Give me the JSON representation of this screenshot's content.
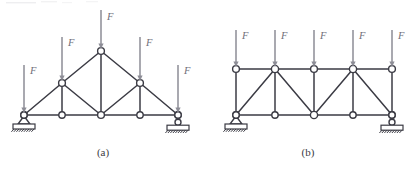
{
  "figure": {
    "background_color": "#ffffff",
    "member_color": "#3b3b44",
    "load_color": "#8d8d96",
    "joint_fill": "#ffffff",
    "width": 411,
    "height": 171
  },
  "captions": {
    "left": "(a)",
    "right": "(b)"
  },
  "load_symbol": "F",
  "trusses": [
    {
      "id": "truss-a",
      "caption": "(a)",
      "caption_position": {
        "x": 103,
        "y": 156
      },
      "type": "fink-roof-truss",
      "joints": [
        {
          "name": "a-bottom-left",
          "x": 24,
          "y": 115,
          "radius": 3.2
        },
        {
          "name": "a-bottom-2",
          "x": 62,
          "y": 115,
          "radius": 3.2
        },
        {
          "name": "a-bottom-mid",
          "x": 101,
          "y": 115,
          "radius": 3.4
        },
        {
          "name": "a-bottom-4",
          "x": 140,
          "y": 115,
          "radius": 3.2
        },
        {
          "name": "a-bottom-right",
          "x": 178,
          "y": 115,
          "radius": 3.2
        },
        {
          "name": "a-upper-left",
          "x": 62,
          "y": 83,
          "radius": 3.4
        },
        {
          "name": "a-apex",
          "x": 101,
          "y": 51,
          "radius": 3.4
        },
        {
          "name": "a-upper-right",
          "x": 140,
          "y": 83,
          "radius": 3.4
        }
      ],
      "members": [
        {
          "name": "a-bottom-chord-1",
          "from": [
            24,
            115
          ],
          "to": [
            62,
            115
          ]
        },
        {
          "name": "a-bottom-chord-2",
          "from": [
            62,
            115
          ],
          "to": [
            101,
            115
          ]
        },
        {
          "name": "a-bottom-chord-3",
          "from": [
            101,
            115
          ],
          "to": [
            140,
            115
          ]
        },
        {
          "name": "a-bottom-chord-4",
          "from": [
            140,
            115
          ],
          "to": [
            178,
            115
          ]
        },
        {
          "name": "a-top-chord-left-lower",
          "from": [
            24,
            115
          ],
          "to": [
            62,
            83
          ]
        },
        {
          "name": "a-top-chord-left-upper",
          "from": [
            62,
            83
          ],
          "to": [
            101,
            51
          ]
        },
        {
          "name": "a-top-chord-right-upper",
          "from": [
            101,
            51
          ],
          "to": [
            140,
            83
          ]
        },
        {
          "name": "a-top-chord-right-lower",
          "from": [
            140,
            83
          ],
          "to": [
            178,
            115
          ]
        },
        {
          "name": "a-vertical-left",
          "from": [
            62,
            83
          ],
          "to": [
            62,
            115
          ]
        },
        {
          "name": "a-vertical-mid",
          "from": [
            101,
            51
          ],
          "to": [
            101,
            115
          ]
        },
        {
          "name": "a-vertical-right",
          "from": [
            140,
            83
          ],
          "to": [
            140,
            115
          ]
        },
        {
          "name": "a-diagonal-left",
          "from": [
            62,
            83
          ],
          "to": [
            101,
            115
          ]
        },
        {
          "name": "a-diagonal-right",
          "from": [
            140,
            83
          ],
          "to": [
            101,
            115
          ]
        }
      ],
      "loads": [
        {
          "name": "a-load-1",
          "label": "F",
          "x": 24,
          "tip_y": 113,
          "tail_y": 65,
          "label_x": 30,
          "label_y": 74
        },
        {
          "name": "a-load-2",
          "label": "F",
          "x": 62,
          "tip_y": 81,
          "tail_y": 37,
          "label_x": 68,
          "label_y": 46
        },
        {
          "name": "a-load-3",
          "label": "F",
          "x": 101,
          "tip_y": 49,
          "tail_y": 10,
          "label_x": 107,
          "label_y": 20
        },
        {
          "name": "a-load-4",
          "label": "F",
          "x": 140,
          "tip_y": 81,
          "tail_y": 37,
          "label_x": 146,
          "label_y": 46
        },
        {
          "name": "a-load-5",
          "label": "F",
          "x": 178,
          "tip_y": 113,
          "tail_y": 65,
          "label_x": 184,
          "label_y": 74
        }
      ],
      "supports": [
        {
          "name": "a-pin-support",
          "kind": "pin",
          "x": 24,
          "y": 115
        },
        {
          "name": "a-roller-support",
          "kind": "roller",
          "x": 178,
          "y": 115
        }
      ]
    },
    {
      "id": "truss-b",
      "caption": "(b)",
      "caption_position": {
        "x": 308,
        "y": 156
      },
      "type": "parallel-chord-truss",
      "joints": [
        {
          "name": "b-top-1",
          "x": 236,
          "y": 69,
          "radius": 3.4
        },
        {
          "name": "b-top-2",
          "x": 275,
          "y": 69,
          "radius": 3.6
        },
        {
          "name": "b-top-3",
          "x": 314,
          "y": 69,
          "radius": 3.4
        },
        {
          "name": "b-top-4",
          "x": 353,
          "y": 69,
          "radius": 3.6
        },
        {
          "name": "b-top-5",
          "x": 392,
          "y": 69,
          "radius": 3.4
        },
        {
          "name": "b-bottom-1",
          "x": 236,
          "y": 115,
          "radius": 3.2
        },
        {
          "name": "b-bottom-2",
          "x": 275,
          "y": 115,
          "radius": 3.2
        },
        {
          "name": "b-bottom-3",
          "x": 314,
          "y": 115,
          "radius": 3.6
        },
        {
          "name": "b-bottom-4",
          "x": 353,
          "y": 115,
          "radius": 3.2
        },
        {
          "name": "b-bottom-5",
          "x": 392,
          "y": 115,
          "radius": 3.2
        }
      ],
      "members": [
        {
          "name": "b-top-chord-1",
          "from": [
            236,
            69
          ],
          "to": [
            275,
            69
          ]
        },
        {
          "name": "b-top-chord-2",
          "from": [
            275,
            69
          ],
          "to": [
            314,
            69
          ]
        },
        {
          "name": "b-top-chord-3",
          "from": [
            314,
            69
          ],
          "to": [
            353,
            69
          ]
        },
        {
          "name": "b-top-chord-4",
          "from": [
            353,
            69
          ],
          "to": [
            392,
            69
          ]
        },
        {
          "name": "b-bottom-chord-1",
          "from": [
            236,
            115
          ],
          "to": [
            275,
            115
          ]
        },
        {
          "name": "b-bottom-chord-2",
          "from": [
            275,
            115
          ],
          "to": [
            314,
            115
          ]
        },
        {
          "name": "b-bottom-chord-3",
          "from": [
            314,
            115
          ],
          "to": [
            353,
            115
          ]
        },
        {
          "name": "b-bottom-chord-4",
          "from": [
            353,
            115
          ],
          "to": [
            392,
            115
          ]
        },
        {
          "name": "b-vertical-1",
          "from": [
            236,
            69
          ],
          "to": [
            236,
            115
          ]
        },
        {
          "name": "b-vertical-2",
          "from": [
            275,
            69
          ],
          "to": [
            275,
            115
          ]
        },
        {
          "name": "b-vertical-3",
          "from": [
            314,
            69
          ],
          "to": [
            314,
            115
          ]
        },
        {
          "name": "b-vertical-4",
          "from": [
            353,
            69
          ],
          "to": [
            353,
            115
          ]
        },
        {
          "name": "b-vertical-5",
          "from": [
            392,
            69
          ],
          "to": [
            392,
            115
          ]
        },
        {
          "name": "b-diagonal-1",
          "from": [
            236,
            115
          ],
          "to": [
            275,
            69
          ]
        },
        {
          "name": "b-diagonal-2",
          "from": [
            275,
            69
          ],
          "to": [
            314,
            115
          ]
        },
        {
          "name": "b-diagonal-3",
          "from": [
            314,
            115
          ],
          "to": [
            353,
            69
          ]
        },
        {
          "name": "b-diagonal-4",
          "from": [
            353,
            69
          ],
          "to": [
            392,
            115
          ]
        }
      ],
      "loads": [
        {
          "name": "b-load-1",
          "label": "F",
          "x": 236,
          "tip_y": 67,
          "tail_y": 30,
          "label_x": 242,
          "label_y": 39
        },
        {
          "name": "b-load-2",
          "label": "F",
          "x": 275,
          "tip_y": 67,
          "tail_y": 30,
          "label_x": 281,
          "label_y": 39
        },
        {
          "name": "b-load-3",
          "label": "F",
          "x": 314,
          "tip_y": 67,
          "tail_y": 30,
          "label_x": 320,
          "label_y": 39
        },
        {
          "name": "b-load-4",
          "label": "F",
          "x": 353,
          "tip_y": 67,
          "tail_y": 30,
          "label_x": 359,
          "label_y": 39
        },
        {
          "name": "b-load-5",
          "label": "F",
          "x": 392,
          "tip_y": 67,
          "tail_y": 30,
          "label_x": 398,
          "label_y": 39
        }
      ],
      "supports": [
        {
          "name": "b-pin-support",
          "kind": "pin",
          "x": 236,
          "y": 115
        },
        {
          "name": "b-roller-support",
          "kind": "roller",
          "x": 392,
          "y": 115
        }
      ]
    }
  ]
}
